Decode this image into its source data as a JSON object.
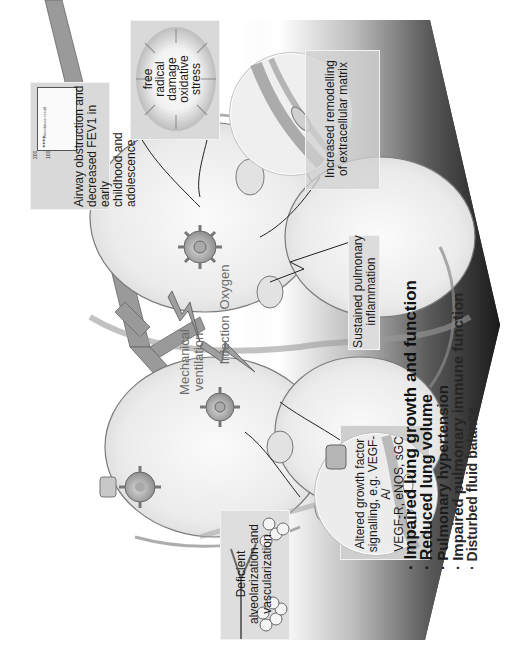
{
  "figure": {
    "orientation": "rotated 90 degrees counter-clockwise",
    "colors": {
      "arrow_light": "#ffffff",
      "arrow_dark": "#1e1e1e",
      "box_fill": "#d9d9d9",
      "lung_fill": "#ececec",
      "label_gray": "#6b6b6b"
    },
    "callouts": {
      "airway": "Airway obstruction and decreased FEV1 in early childhood and adolescence",
      "airway_lines": [
        "Airway obstruction and",
        "decreased FEV1 in early",
        "childhood and adolescence"
      ],
      "free_radical_lines": [
        "free",
        "radical",
        "damage",
        "oxidative",
        "stress"
      ],
      "remodelling_lines": [
        "Increased remodelling",
        "of extracellular matrix"
      ],
      "inflammation_lines": [
        "Sustained pulmonary",
        "inflammation"
      ],
      "growth_factor_lines": [
        "Altered growth factor",
        "signalling, e.g. VEGF-A/",
        "VEGF-R, eNOS, sGC"
      ],
      "alveolarization_lines": [
        "Deficient",
        "alveolarization and",
        "vascularization"
      ]
    },
    "insults": {
      "mechanical_lines": [
        "Mechanical",
        "ventilation"
      ],
      "infection": "Infection",
      "oxygen": "Oxygen"
    },
    "inset_chart": {
      "tick_top": "200",
      "tick_mid": "100",
      "legend": "Resistance-result",
      "ticks_right": [
        "0",
        "5",
        "10"
      ]
    },
    "outcomes": [
      "· Impaired lung growth and function",
      "· Reduced lung volume",
      "· Pulmonary hypertension",
      "· Impaired pulmonary immune function",
      "· Disturbed fluid balance"
    ]
  }
}
